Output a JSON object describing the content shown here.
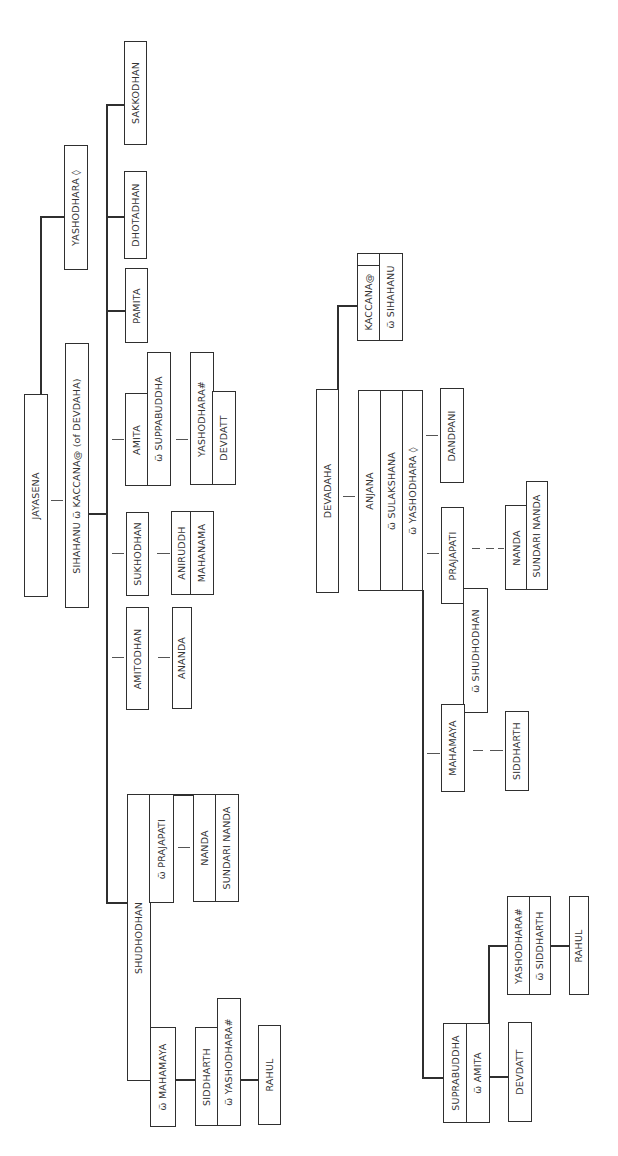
{
  "diagram": {
    "type": "family-tree",
    "orientation": "rotated-90-ccw",
    "line_color": "#2f2f2f",
    "background": "#ffffff",
    "tree_sakya": {
      "root": "JAYASENA",
      "root_spouse_line": "SIHAHANU ѿ KACCANA@ (of DEVDAHA)",
      "root_sibling": "YASHODHARA ◊",
      "sons_of_sihahanu": [
        {
          "name": "SHUDHODHAN",
          "spouses": [
            "ѿ MAHAMAYA",
            "ѿ PRAJAPATI"
          ],
          "children_with_mahamaya": {
            "couple": [
              "SIDDHARTH",
              "ѿ YASHODHARA#"
            ],
            "child": "RAHUL"
          },
          "children_with_prajapati": [
            "NANDA",
            "SUNDARI NANDA"
          ]
        },
        {
          "name": "AMITODHAN",
          "children": [
            "ANANDA"
          ]
        },
        {
          "name": "SUKHODHAN",
          "children": [
            "ANIRUDDH",
            "MAHANAMA"
          ]
        },
        {
          "name": "AMITA",
          "spouse": "ѿ SUPPABUDDHA",
          "children": [
            "YASHODHARA#",
            "DEVDATT"
          ]
        },
        {
          "name": "PAMITA"
        },
        {
          "name": "DHOTADHAN"
        },
        {
          "name": "SAKKODHAN"
        }
      ]
    },
    "tree_koliya": {
      "root": "DEVADAHA",
      "root_child": {
        "couple": [
          "KACCANA@",
          "ѿ SIHAHANU"
        ]
      },
      "son_group": [
        "ANJANA",
        "ѿ SULAKSHANA",
        "ѿ YASHODHARA ◊"
      ],
      "children": [
        {
          "name": "DANDPANI"
        },
        {
          "name": "PRAJAPATI",
          "spouse": "ѿ SHUDHODHAN",
          "children": [
            "NANDA",
            "SUNDARI NANDA"
          ]
        },
        {
          "name": "MAHAMAYA",
          "children": [
            "SIDDHARTH"
          ]
        },
        {
          "name": "SUPRABUDDHA",
          "spouse": "ѿ AMITA",
          "children": [
            {
              "couple": [
                "YASHODHARA#",
                "ѿ SIDDHARTH"
              ],
              "child": "RAHUL"
            },
            "DEVDATT"
          ]
        }
      ]
    }
  },
  "labels": {
    "jayasena": "JAYASENA",
    "sihahanu_kaccana": "SIHAHANU ѿ KACCANA@ (of DEVDAHA)",
    "yashodhara0_top": "YASHODHARA ◊",
    "sakkodhan": "SAKKODHAN",
    "dhotadhan": "DHOTADHAN",
    "pamita": "PAMITA",
    "amita": "AMITA",
    "suppabuddha": "ѿ SUPPABUDDHA",
    "yashodhara_hash_l": "YASHODHARA#",
    "devdatt_l": "DEVDATT",
    "sukhodhan": "SUKHODHAN",
    "aniruddh": "ANIRUDDH",
    "mahanama": "MAHANAMA",
    "amitodhan": "AMITODHAN",
    "ananda": "ANANDA",
    "shudhodhan": "SHUDHODHAN",
    "prajapati_w": "ѿ PRAJAPATI",
    "nanda_l": "NANDA",
    "sundari_nanda_l": "SUNDARI NANDA",
    "mahamaya_w": "ѿ MAHAMAYA",
    "siddharth_l": "SIDDHARTH",
    "yashodhara_hash_w": "ѿ YASHODHARA#",
    "rahul_l": "RAHUL",
    "kaccana": "KACCANA@",
    "sihahanu_w": "ѿ SIHAHANU",
    "devadaha": "DEVADAHA",
    "anjana": "ANJANA",
    "sulakshana_w": "ѿ SULAKSHANA",
    "yashodhara0_w": "ѿ YASHODHARA ◊",
    "dandpani": "DANDPANI",
    "prajapati": "PRAJAPATI",
    "shudhodhan_w": "ѿ SHUDHODHAN",
    "nanda_r": "NANDA",
    "sundari_nanda_r": "SUNDARI NANDA",
    "mahamaya": "MAHAMAYA",
    "siddharth_r": "SIDDHARTH",
    "suprabuddha": "SUPRABUDDHA",
    "amita_w": "ѿ AMITA",
    "devdatt_r": "DEVDATT",
    "yashodhara_hash_r": "YASHODHARA#",
    "siddharth_w": "ѿ SIDDHARTH",
    "rahul_r": "RAHUL"
  }
}
